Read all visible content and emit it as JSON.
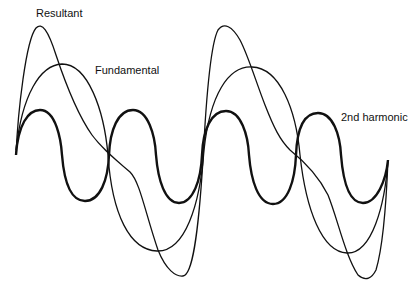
{
  "diagram": {
    "labels": {
      "resultant": "Resultant",
      "fundamental": "Fundamental",
      "second_harmonic": "2nd harmonic"
    },
    "curves": [
      {
        "name": "Fundamental",
        "stroke": "#111111",
        "width": 1.3
      },
      {
        "name": "2nd harmonic",
        "stroke": "#111111",
        "width": 2.4
      },
      {
        "name": "Resultant",
        "stroke": "#111111",
        "width": 1.3
      }
    ]
  }
}
